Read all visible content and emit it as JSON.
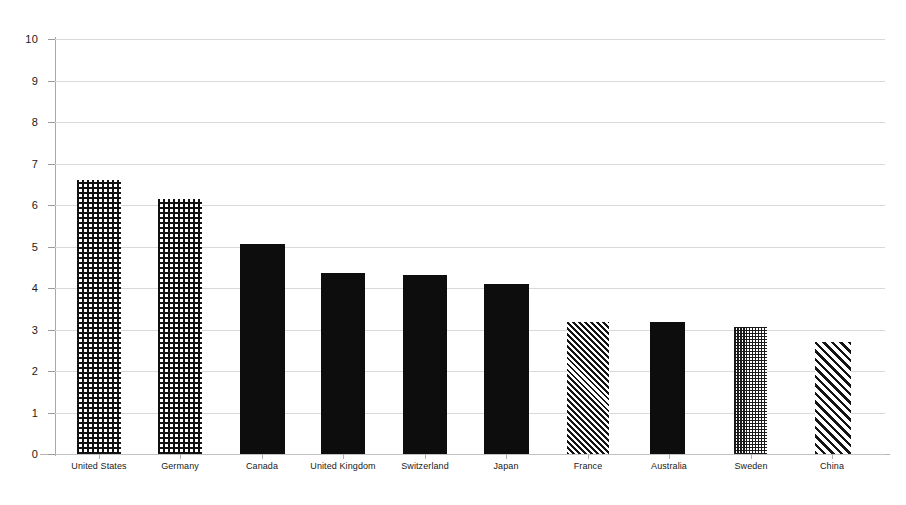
{
  "chart_data": {
    "type": "bar",
    "title": "",
    "subtitle": "",
    "xlabel": "",
    "ylabel": "",
    "ylim": [
      0,
      10
    ],
    "ytick_labels": [
      "0",
      "1",
      "2",
      "3",
      "4",
      "5",
      "6",
      "7",
      "8",
      "9",
      "10"
    ],
    "ytick_values": [
      0,
      1,
      2,
      3,
      4,
      5,
      6,
      7,
      8,
      9,
      10
    ],
    "grid": true,
    "legend": null,
    "categories": [
      "United States",
      "Germany",
      "Canada",
      "United Kingdom",
      "Switzerland",
      "Japan",
      "France",
      "Australia",
      "Sweden",
      "China"
    ],
    "values": [
      6.6,
      6.15,
      5.05,
      4.35,
      4.32,
      4.1,
      3.18,
      3.17,
      3.05,
      2.7
    ],
    "bar_patterns": [
      "grid",
      "grid",
      "solid",
      "solid",
      "solid",
      "solid",
      "hatch-fine",
      "solid",
      "checkerboard",
      "hatch-wide"
    ],
    "colors": {
      "bar_ink": "#0d0d0d",
      "bar_background": "#ffffff",
      "gridline": "#d9d9d9",
      "axis": "#a8a8a8",
      "text": "#1a1a1a",
      "plot_background": "#ffffff"
    }
  }
}
